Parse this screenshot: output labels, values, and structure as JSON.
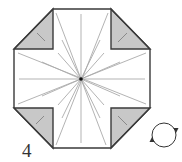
{
  "step": {
    "number": "4"
  },
  "colors": {
    "outline": "#3a3a3a",
    "flap_fill": "#c8c8c8",
    "crease": "#aaaaaa",
    "paper": "#ffffff",
    "center_dot": "#111111",
    "arrow": "#333333"
  },
  "icons": {
    "turn_over": "turn-over-icon"
  },
  "diagram": {
    "shape": "octagon",
    "flaps": [
      "top-left",
      "top-right",
      "bottom-left",
      "bottom-right"
    ],
    "crease_count": 16
  }
}
